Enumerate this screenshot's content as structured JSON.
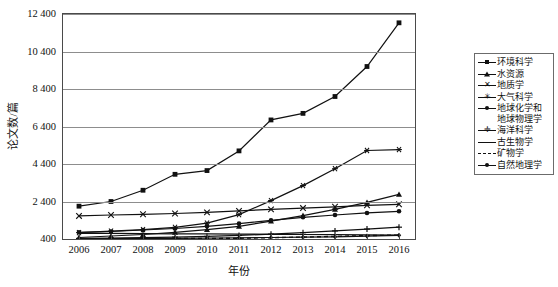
{
  "chart_data": {
    "type": "line",
    "title": "",
    "xlabel": "年份",
    "ylabel": "论文数/篇",
    "x": [
      2006,
      2007,
      2008,
      2009,
      2010,
      2011,
      2012,
      2013,
      2014,
      2015,
      2016
    ],
    "xticks": [
      "2006",
      "2007",
      "2008",
      "2009",
      "2010",
      "2011",
      "2012",
      "2013",
      "2014",
      "2015",
      "2016"
    ],
    "yticks": [
      "400",
      "2 400",
      "4 400",
      "6 400",
      "8 400",
      "10 400",
      "12 400"
    ],
    "ytick_values": [
      400,
      2400,
      4400,
      6400,
      8400,
      10400,
      12400
    ],
    "ylim": [
      400,
      12400
    ],
    "grid": "horizontal",
    "legend_position": "right",
    "series": [
      {
        "name": "环境科学",
        "marker": "square",
        "line": "solid",
        "values": [
          2150,
          2400,
          3000,
          3850,
          4050,
          5100,
          6750,
          7100,
          8000,
          9600,
          11930
        ]
      },
      {
        "name": "水资源",
        "marker": "triangle",
        "line": "solid",
        "values": [
          480,
          560,
          640,
          760,
          900,
          1080,
          1350,
          1650,
          1980,
          2350,
          2780
        ]
      },
      {
        "name": "地质学",
        "marker": "x",
        "line": "solid",
        "values": [
          1630,
          1680,
          1720,
          1760,
          1820,
          1900,
          1980,
          2050,
          2120,
          2200,
          2250
        ]
      },
      {
        "name": "大气科学",
        "marker": "asterisk",
        "line": "solid",
        "values": [
          740,
          820,
          900,
          1020,
          1250,
          1700,
          2450,
          3250,
          4150,
          5120,
          5170
        ]
      },
      {
        "name": "地球化学和\n地球物理学",
        "marker": "dot",
        "line": "solid",
        "values": [
          760,
          800,
          880,
          960,
          1080,
          1220,
          1400,
          1560,
          1680,
          1790,
          1880
        ]
      },
      {
        "name": "海洋科学",
        "marker": "plus",
        "line": "solid",
        "values": [
          430,
          450,
          470,
          500,
          540,
          590,
          660,
          740,
          830,
          930,
          1030
        ]
      },
      {
        "name": "古生物学",
        "marker": "none",
        "line": "solid",
        "values": [
          700,
          700,
          690,
          680,
          670,
          660,
          650,
          640,
          630,
          620,
          610
        ]
      },
      {
        "name": "矿物学",
        "marker": "none",
        "line": "dashed",
        "values": [
          400,
          405,
          410,
          420,
          430,
          445,
          470,
          500,
          540,
          580,
          610
        ]
      },
      {
        "name": "自然地理学",
        "marker": "smalldiamond",
        "line": "solid",
        "values": [
          420,
          425,
          430,
          440,
          450,
          462,
          478,
          495,
          520,
          555,
          600
        ]
      }
    ]
  },
  "legend": {
    "items": [
      {
        "label": "环境科学",
        "marker": "square",
        "line": "solid"
      },
      {
        "label": "水资源",
        "marker": "triangle",
        "line": "solid"
      },
      {
        "label": "地质学",
        "marker": "x",
        "line": "solid"
      },
      {
        "label": "大气科学",
        "marker": "asterisk",
        "line": "solid"
      },
      {
        "label": "地球化学和\n地球物理学",
        "marker": "dot",
        "line": "solid"
      },
      {
        "label": "海洋科学",
        "marker": "plus",
        "line": "solid"
      },
      {
        "label": "古生物学",
        "marker": "none",
        "line": "solid"
      },
      {
        "label": "矿物学",
        "marker": "none",
        "line": "dashed"
      },
      {
        "label": "自然地理学",
        "marker": "smalldiamond",
        "line": "solid"
      }
    ]
  },
  "colors": {
    "line": "#111111",
    "grid": "#8d8d8d",
    "frame": "#4a4a4a",
    "background": "#ffffff"
  }
}
